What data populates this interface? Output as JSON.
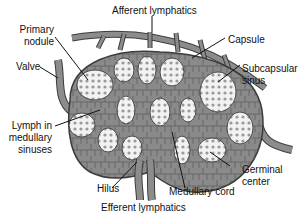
{
  "diagram": {
    "colors": {
      "tissue": "#8a8a8a",
      "tissue_dark": "#5a5a5a",
      "vessel": "#8c8c8c",
      "outline": "#3c3c3c",
      "nodule_fill": "#e8e8e8",
      "background": "#ffffff",
      "text": "#111111"
    },
    "labels": {
      "afferent": "Afferent lymphatics",
      "primary_nodule_1": "Primary",
      "primary_nodule_2": "nodule",
      "valve": "Valve",
      "capsule": "Capsule",
      "subcapsular_1": "Subcapsular",
      "subcapsular_2": "sinus",
      "lymph_1": "Lymph in",
      "lymph_2": "medullary",
      "lymph_3": "sinuses",
      "germinal_1": "Germinal",
      "germinal_2": "center",
      "hilus": "Hilus",
      "medullary_cord": "Medullary cord",
      "efferent": "Efferent lymphatics"
    }
  }
}
